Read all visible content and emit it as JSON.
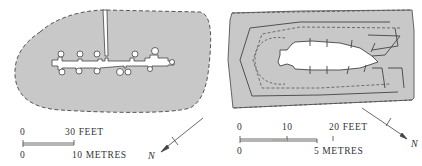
{
  "figure": {
    "colors": {
      "fill": "#c8c8c8",
      "line": "#444444",
      "background": "#ffffff",
      "void": "#ffffff"
    },
    "plan_left": {
      "description": "oval mound plan with central passage and side chambers",
      "scale": {
        "feet_start": "0",
        "feet_end": "30 FEET",
        "metres_start": "0",
        "metres_end": "10 METRES"
      },
      "north_label": "N"
    },
    "plan_right": {
      "description": "rectangular mound plan with cruciform chamber and passage",
      "scale": {
        "feet_start": "0",
        "feet_mid": "10",
        "feet_end": "20 FEET",
        "metres_start": "0",
        "metres_end": "5 METRES"
      },
      "north_label": "N"
    }
  }
}
